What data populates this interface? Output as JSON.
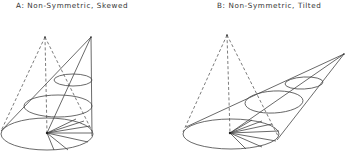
{
  "panels": [
    {
      "id": "A",
      "label": "A: Non-Symmetric, Skewed",
      "dashed_apex": [
        45,
        37
      ],
      "solid_apex": [
        91,
        37
      ],
      "base": {
        "cx": 47,
        "cy": 134,
        "rx": 46,
        "ry": 16
      },
      "base_center": [
        47,
        133
      ],
      "ellipses": [
        {
          "cx": 58,
          "cy": 106,
          "rx": 34,
          "ry": 11
        },
        {
          "cx": 73,
          "cy": 80,
          "rx": 19,
          "ry": 6
        }
      ]
    },
    {
      "id": "B",
      "label": "B: Non-Symmetric, Tilted",
      "dashed_apex": [
        227,
        35
      ],
      "solid_apex": [
        344,
        54
      ],
      "base": {
        "cx": 231,
        "cy": 134,
        "rx": 48,
        "ry": 15
      },
      "base_center": [
        230,
        133
      ],
      "ellipses": [
        {
          "cx": 274,
          "cy": 102,
          "rx": 29,
          "ry": 11
        },
        {
          "cx": 304,
          "cy": 83,
          "rx": 19,
          "ry": 6
        }
      ]
    }
  ]
}
